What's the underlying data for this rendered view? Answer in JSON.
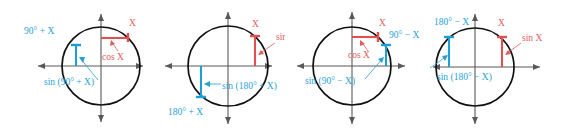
{
  "figure": {
    "colors": {
      "blue": "#2a9fd6",
      "red": "#e05c5c",
      "circle": "#111111",
      "axis": "#58595b",
      "background": "#ffffff"
    }
  },
  "panels": [
    {
      "id": "panel-1",
      "identity": "sin (90 deg + X)",
      "labels": {
        "angle_blue": "90° + X",
        "angle_red": "X",
        "value_red": "cos X",
        "value_blue": "sin (90° + X)"
      }
    },
    {
      "id": "panel-2",
      "identity": "sin (180 deg + X)",
      "labels": {
        "angle_blue": "180° + X",
        "angle_red": "X",
        "value_red": "sin X",
        "value_blue": "sin (180° + X)"
      }
    },
    {
      "id": "panel-3",
      "identity": "sin (90 deg - X)",
      "labels": {
        "angle_blue": "90° − X",
        "angle_red": "X",
        "value_red": "cos X",
        "value_blue": "sin (90° − X)"
      }
    },
    {
      "id": "panel-4",
      "identity": "sin (180 deg - X)",
      "labels": {
        "angle_blue": "180° − X",
        "angle_red": "X",
        "value_red": "sin X",
        "value_blue": "sin (180° − X)"
      }
    }
  ]
}
